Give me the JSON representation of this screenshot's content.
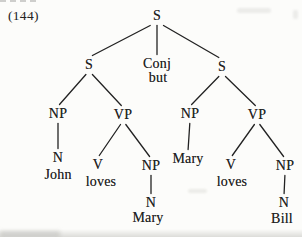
{
  "colors": {
    "ink": "#222222",
    "paper": "#fcfcfa"
  },
  "figure": {
    "label": "(144)"
  },
  "tree": {
    "nodes": [
      {
        "id": "s-root",
        "label": "S",
        "x": 157,
        "y": 16
      },
      {
        "id": "s-left",
        "label": "S",
        "x": 89,
        "y": 65
      },
      {
        "id": "conj",
        "label": "Conj",
        "x": 157,
        "y": 64
      },
      {
        "id": "but",
        "label": "but",
        "x": 158,
        "y": 78
      },
      {
        "id": "s-right",
        "label": "S",
        "x": 222,
        "y": 67
      },
      {
        "id": "np-1",
        "label": "NP",
        "x": 58,
        "y": 114
      },
      {
        "id": "vp-1",
        "label": "VP",
        "x": 123,
        "y": 115
      },
      {
        "id": "np-2",
        "label": "NP",
        "x": 190,
        "y": 114
      },
      {
        "id": "vp-2",
        "label": "VP",
        "x": 257,
        "y": 115
      },
      {
        "id": "n-1",
        "label": "N",
        "x": 58,
        "y": 158
      },
      {
        "id": "john",
        "label": "John",
        "x": 58,
        "y": 175
      },
      {
        "id": "v-1",
        "label": "V",
        "x": 98,
        "y": 165
      },
      {
        "id": "loves-1",
        "label": "loves",
        "x": 101,
        "y": 182
      },
      {
        "id": "np-3",
        "label": "NP",
        "x": 151,
        "y": 166
      },
      {
        "id": "mary-1",
        "label": "Mary",
        "x": 188,
        "y": 159
      },
      {
        "id": "n-2",
        "label": "N",
        "x": 151,
        "y": 203
      },
      {
        "id": "mary-2",
        "label": "Mary",
        "x": 148,
        "y": 218
      },
      {
        "id": "v-2",
        "label": "V",
        "x": 231,
        "y": 165
      },
      {
        "id": "loves-2",
        "label": "loves",
        "x": 232,
        "y": 182
      },
      {
        "id": "np-4",
        "label": "NP",
        "x": 285,
        "y": 166
      },
      {
        "id": "n-3",
        "label": "N",
        "x": 284,
        "y": 203
      },
      {
        "id": "bill",
        "label": "Bill",
        "x": 282,
        "y": 219
      }
    ],
    "edges": [
      {
        "from": "s-root",
        "to": "s-left"
      },
      {
        "from": "s-root",
        "to": "conj"
      },
      {
        "from": "s-root",
        "to": "s-right"
      },
      {
        "from": "s-left",
        "to": "np-1"
      },
      {
        "from": "s-left",
        "to": "vp-1"
      },
      {
        "from": "np-1",
        "to": "n-1"
      },
      {
        "from": "vp-1",
        "to": "v-1"
      },
      {
        "from": "vp-1",
        "to": "np-3"
      },
      {
        "from": "np-3",
        "to": "n-2"
      },
      {
        "from": "s-right",
        "to": "np-2"
      },
      {
        "from": "s-right",
        "to": "vp-2"
      },
      {
        "from": "np-2",
        "to": "mary-1"
      },
      {
        "from": "vp-2",
        "to": "v-2"
      },
      {
        "from": "vp-2",
        "to": "np-4"
      },
      {
        "from": "np-4",
        "to": "n-3"
      }
    ]
  }
}
